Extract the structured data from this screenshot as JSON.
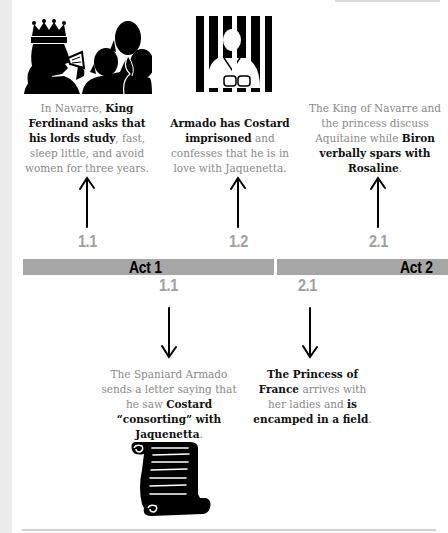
{
  "timeline": {
    "acts": [
      {
        "label": "Act 1"
      },
      {
        "label": "Act 2"
      }
    ],
    "colors": {
      "bar": "#a6a6a6",
      "scene_label": "#a0a0a0",
      "text_light": "#8a8a8a",
      "text_bold": "#111111"
    }
  },
  "events_above": [
    {
      "scene": "1.1",
      "icon": "king-and-lords-icon",
      "parts": [
        {
          "t": "In Navarre, ",
          "b": false
        },
        {
          "t": "King Ferdinand asks that his lords study",
          "b": true
        },
        {
          "t": ", fast, sleep little, and avoid women for three years.",
          "b": false
        }
      ]
    },
    {
      "scene": "1.2",
      "icon": "prisoner-behind-bars-icon",
      "parts": [
        {
          "t": "Armado has Costard imprisoned",
          "b": true
        },
        {
          "t": " and confesses that he is in love with Jaquenetta.",
          "b": false
        }
      ]
    },
    {
      "scene": "2.1",
      "icon": "",
      "parts": [
        {
          "t": "The King of Navarre and the princess discuss Aquitaine while ",
          "b": false
        },
        {
          "t": "Biron verbally spars with Rosaline",
          "b": true
        },
        {
          "t": ".",
          "b": false
        }
      ]
    }
  ],
  "events_below": [
    {
      "scene": "1.1",
      "icon": "scroll-letter-icon",
      "parts": [
        {
          "t": "The Spaniard Armado sends a letter saying that he saw ",
          "b": false
        },
        {
          "t": "Costard “consorting” with Jaquenetta",
          "b": true
        },
        {
          "t": ".",
          "b": false
        }
      ]
    },
    {
      "scene": "2.1",
      "icon": "",
      "parts": [
        {
          "t": "The Princess of France",
          "b": true
        },
        {
          "t": " arrives with her ladies and ",
          "b": false
        },
        {
          "t": "is encamped in a field",
          "b": true
        },
        {
          "t": ".",
          "b": false
        }
      ]
    }
  ]
}
